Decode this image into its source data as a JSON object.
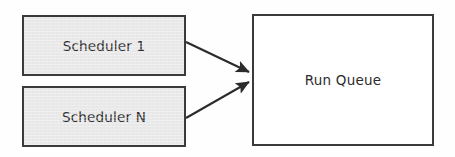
{
  "diagram": {
    "type": "flow-diagram",
    "background_color": "#fefefe",
    "nodes": [
      {
        "id": "scheduler-1",
        "label": "Scheduler 1",
        "shape": "rectangle",
        "fill_color": "#e9e9e9",
        "border_color": "#3a3a3a",
        "text_color": "#2b2b2b",
        "x": 22,
        "y": 15,
        "width": 164,
        "height": 61
      },
      {
        "id": "scheduler-n",
        "label": "Scheduler N",
        "shape": "rectangle",
        "fill_color": "#e9e9e9",
        "border_color": "#3a3a3a",
        "text_color": "#2b2b2b",
        "x": 22,
        "y": 86,
        "width": 164,
        "height": 61
      },
      {
        "id": "run-queue",
        "label": "Run Queue",
        "shape": "rectangle",
        "fill_color": "#ffffff",
        "border_color": "#3a3a3a",
        "text_color": "#2b2b2b",
        "x": 252,
        "y": 14,
        "width": 182,
        "height": 132
      }
    ],
    "edges": [
      {
        "id": "edge-scheduler-1-to-run-queue",
        "from": "scheduler-1",
        "to": "run-queue",
        "arrowhead": "filled-triangle",
        "color": "#2b2b2b",
        "from_x": 186,
        "from_y": 42,
        "to_x": 251,
        "to_y": 73
      },
      {
        "id": "edge-scheduler-n-to-run-queue",
        "from": "scheduler-n",
        "to": "run-queue",
        "arrowhead": "filled-triangle",
        "color": "#2b2b2b",
        "from_x": 186,
        "from_y": 118,
        "to_x": 251,
        "to_y": 81
      }
    ]
  }
}
